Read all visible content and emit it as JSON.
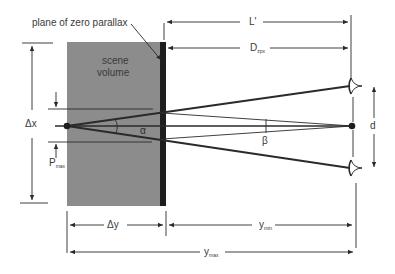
{
  "diagram": {
    "title_label": "plane of zero parallax",
    "scene_label_line1": "scene",
    "scene_label_line2": "volume",
    "labels": {
      "L_prime": "L'",
      "D_main": "D",
      "D_sub": "zpx",
      "delta_x": "Δx",
      "P_main": "P",
      "P_sub": "max",
      "alpha": "α",
      "beta": "β",
      "d": "d",
      "delta_y": "Δy",
      "ymin_main": "y",
      "ymin_sub": "min",
      "ymax_main": "y",
      "ymax_sub": "max"
    },
    "colors": {
      "scene_fill": "#8c8c8c",
      "plane_fill": "#1e1e1e",
      "line": "#2a2a2a",
      "text": "#3a3a3a"
    }
  }
}
